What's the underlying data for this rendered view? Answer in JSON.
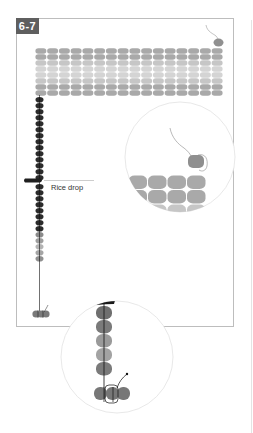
{
  "figure": {
    "step_label": "6-7",
    "callouts": {
      "rice_drop": "Rice drop"
    }
  },
  "grid": {
    "columns": 16,
    "rows": 8,
    "row_shades": [
      "mid",
      "mid",
      "light",
      "lighter",
      "lighter",
      "light",
      "mid",
      "mid"
    ]
  },
  "column": {
    "dark_beads_above_drop": 14,
    "dark_beads_below_drop": 8,
    "gray_beads_bottom": 5
  },
  "colors": {
    "mid_gray": "#a9a9a9",
    "light_gray": "#c6c6c6",
    "lighter_gray": "#d4d4d4",
    "dark_bead": "#2b2b2b",
    "bottom_gray": "#8d8d8d",
    "frame": "#bdbdbd",
    "circle_outline": "#e2e2e2",
    "label_bg": "#5f5f5f"
  }
}
